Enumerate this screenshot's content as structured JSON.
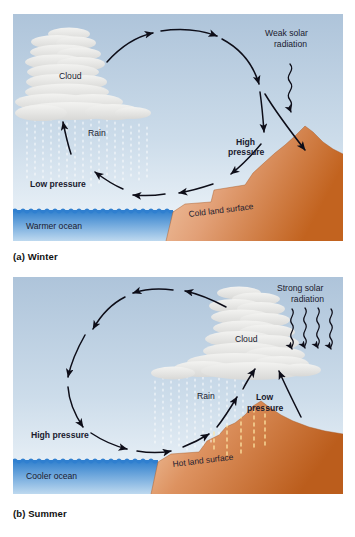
{
  "figure": {
    "panels": [
      {
        "id": "winter",
        "caption": "(a) Winter",
        "labels": {
          "cloud": "Cloud",
          "rain": "Rain",
          "low_pressure": "Low pressure",
          "high_pressure": "High pressure",
          "solar": "Weak solar radiation",
          "solar_line1": "Weak solar",
          "solar_line2": "radiation",
          "ocean": "Warmer ocean",
          "land": "Cold land surface"
        }
      },
      {
        "id": "summer",
        "caption": "(b) Summer",
        "labels": {
          "cloud": "Cloud",
          "rain": "Rain",
          "low_pressure": "Low pressure",
          "high_pressure": "High pressure",
          "solar": "Strong solar radiation",
          "solar_line1": "Strong solar",
          "solar_line2": "radiation",
          "ocean": "Cooler ocean",
          "land": "Hot land surface"
        }
      }
    ]
  },
  "colors": {
    "sky_top": "#aec4da",
    "sky_bottom": "#eef4f9",
    "ocean_top": "#2f7fd0",
    "ocean_bottom": "#bcd8ef",
    "land_light": "#f0c5a2",
    "land_dark": "#c4642c",
    "cloud": "#e3e3e1",
    "arrow": "#0d0d18",
    "text": "#1a1a2e",
    "page_bg": "#ffffff",
    "heat_line": "#ffe9a8"
  }
}
